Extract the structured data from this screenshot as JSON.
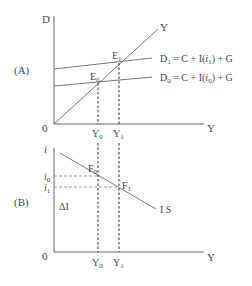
{
  "panel_a": {
    "tag": "(A)",
    "y_axis_label": "D",
    "x_axis_label": "Y",
    "origin_label": "0",
    "line_45_label": "Y",
    "curves": [
      {
        "name": "D1",
        "label_main": "D",
        "label_sub": "1",
        "label_rest": " = C + I(",
        "label_i": "i",
        "label_isub": "1",
        "label_end": ") + G"
      },
      {
        "name": "D0",
        "label_main": "D",
        "label_sub": "0",
        "label_rest": " = C + I(",
        "label_i": "i",
        "label_isub": "0",
        "label_end": ") + G"
      }
    ],
    "points": [
      {
        "main": "E",
        "sub": "0"
      },
      {
        "main": "E",
        "sub": "1"
      }
    ],
    "x_ticks": [
      {
        "main": "Y",
        "sub": "0"
      },
      {
        "main": "Y",
        "sub": "1"
      }
    ]
  },
  "panel_b": {
    "tag": "(B)",
    "y_axis_label": "i",
    "x_axis_label": "Y",
    "origin_label": "0",
    "curve_label": "I S",
    "delta_label": "ΔI",
    "y_ticks": [
      {
        "main": "i",
        "sub": "0"
      },
      {
        "main": "i",
        "sub": "1"
      }
    ],
    "points": [
      {
        "main": "F",
        "sub": "0"
      },
      {
        "main": "F",
        "sub": "1"
      }
    ],
    "x_ticks": [
      {
        "main": "Y",
        "sub": "0"
      },
      {
        "main": "Y",
        "sub": "1"
      }
    ]
  }
}
